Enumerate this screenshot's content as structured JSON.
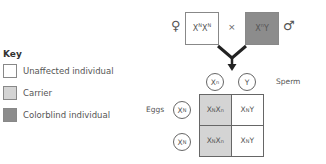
{
  "key": {
    "title": "Key",
    "items": [
      {
        "label": "Unaffected individual",
        "color": "#ffffff"
      },
      {
        "label": "Carrier",
        "color": "#d4d4d4"
      },
      {
        "label": "Colorblind individual",
        "color": "#8c8c8c"
      }
    ]
  },
  "cross": {
    "female_symbol": "♀",
    "male_symbol": "♂",
    "times": "×",
    "female_genotype": {
      "base1": "X",
      "sup1": "N",
      "base2": "X",
      "sup2": "N",
      "color": "#ffffff"
    },
    "male_genotype": {
      "base1": "X",
      "sup1": "n",
      "base2": "Y",
      "color": "#8c8c8c"
    }
  },
  "punnett": {
    "sperm_label": "Sperm",
    "eggs_label": "Eggs",
    "sperm": [
      {
        "base": "X",
        "sup": "n"
      },
      {
        "base": "Y",
        "sup": ""
      }
    ],
    "eggs": [
      {
        "base": "X",
        "sup": "N"
      },
      {
        "base": "X",
        "sup": "N"
      }
    ],
    "cells": [
      [
        {
          "a": "X",
          "as": "N",
          "b": "X",
          "bs": "n",
          "color": "#d4d4d4"
        },
        {
          "a": "X",
          "as": "N",
          "b": "Y",
          "bs": "",
          "color": "#ffffff"
        }
      ],
      [
        {
          "a": "X",
          "as": "N",
          "b": "X",
          "bs": "n",
          "color": "#d4d4d4"
        },
        {
          "a": "X",
          "as": "N",
          "b": "Y",
          "bs": "",
          "color": "#ffffff"
        }
      ]
    ]
  }
}
